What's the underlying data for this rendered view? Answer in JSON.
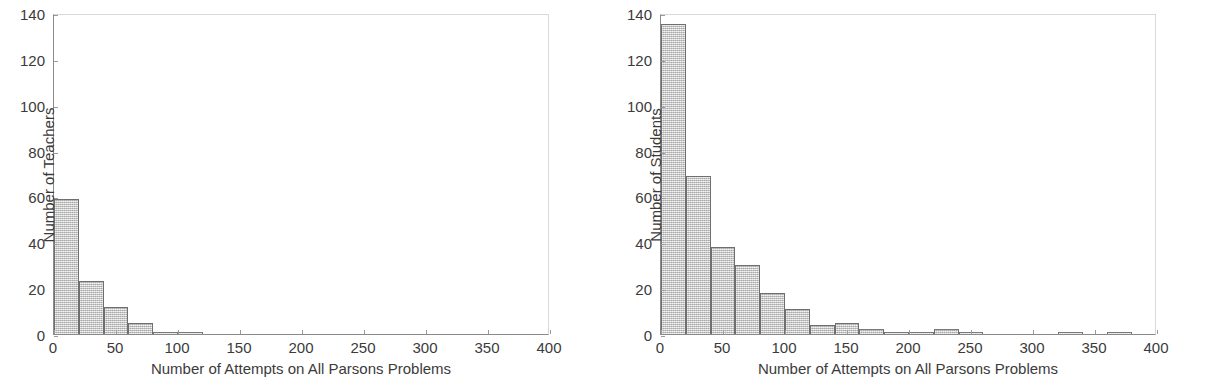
{
  "figure": {
    "background": "#ffffff",
    "bar_fill": "#c9c9c9",
    "bar_edge": "#6f6f6f",
    "axis_color": "#8a8a8a",
    "text_color": "#3b3b3b"
  },
  "panels": [
    {
      "id": "teachers",
      "chart_data": {
        "type": "bar",
        "title": "",
        "subtitle": "",
        "xlabel": "Number of Attempts on All Parsons Problems",
        "ylabel": "Number of Teachers",
        "xlim": [
          0,
          400
        ],
        "ylim": [
          0,
          140
        ],
        "xticks": [
          0,
          50,
          100,
          150,
          200,
          250,
          300,
          350,
          400
        ],
        "yticks": [
          0,
          20,
          40,
          60,
          80,
          100,
          120,
          140
        ],
        "grid": false,
        "legend": null,
        "bin_width": 20,
        "bins": [
          {
            "x0": 0,
            "x1": 20,
            "value": 59
          },
          {
            "x0": 20,
            "x1": 40,
            "value": 23
          },
          {
            "x0": 40,
            "x1": 60,
            "value": 12
          },
          {
            "x0": 60,
            "x1": 80,
            "value": 5
          },
          {
            "x0": 80,
            "x1": 100,
            "value": 1
          },
          {
            "x0": 100,
            "x1": 120,
            "value": 1
          },
          {
            "x0": 120,
            "x1": 140,
            "value": 0
          },
          {
            "x0": 140,
            "x1": 160,
            "value": 0
          },
          {
            "x0": 160,
            "x1": 180,
            "value": 0
          },
          {
            "x0": 180,
            "x1": 200,
            "value": 0
          },
          {
            "x0": 200,
            "x1": 220,
            "value": 0
          },
          {
            "x0": 220,
            "x1": 240,
            "value": 0
          },
          {
            "x0": 240,
            "x1": 260,
            "value": 0
          },
          {
            "x0": 260,
            "x1": 280,
            "value": 0
          },
          {
            "x0": 280,
            "x1": 300,
            "value": 0
          },
          {
            "x0": 300,
            "x1": 320,
            "value": 0
          },
          {
            "x0": 320,
            "x1": 340,
            "value": 0
          },
          {
            "x0": 340,
            "x1": 360,
            "value": 0
          },
          {
            "x0": 360,
            "x1": 380,
            "value": 0
          },
          {
            "x0": 380,
            "x1": 400,
            "value": 0
          }
        ]
      }
    },
    {
      "id": "students",
      "chart_data": {
        "type": "bar",
        "title": "",
        "subtitle": "",
        "xlabel": "Number of Attempts on All Parsons Problems",
        "ylabel": "Number of Students",
        "xlim": [
          0,
          400
        ],
        "ylim": [
          0,
          140
        ],
        "xticks": [
          0,
          50,
          100,
          150,
          200,
          250,
          300,
          350,
          400
        ],
        "yticks": [
          0,
          20,
          40,
          60,
          80,
          100,
          120,
          140
        ],
        "grid": false,
        "legend": null,
        "bin_width": 20,
        "bins": [
          {
            "x0": 0,
            "x1": 20,
            "value": 135
          },
          {
            "x0": 20,
            "x1": 40,
            "value": 69
          },
          {
            "x0": 40,
            "x1": 60,
            "value": 38
          },
          {
            "x0": 60,
            "x1": 80,
            "value": 30
          },
          {
            "x0": 80,
            "x1": 100,
            "value": 18
          },
          {
            "x0": 100,
            "x1": 120,
            "value": 11
          },
          {
            "x0": 120,
            "x1": 140,
            "value": 4
          },
          {
            "x0": 140,
            "x1": 160,
            "value": 5
          },
          {
            "x0": 160,
            "x1": 180,
            "value": 2
          },
          {
            "x0": 180,
            "x1": 200,
            "value": 1
          },
          {
            "x0": 200,
            "x1": 220,
            "value": 1
          },
          {
            "x0": 220,
            "x1": 240,
            "value": 2
          },
          {
            "x0": 240,
            "x1": 260,
            "value": 1
          },
          {
            "x0": 260,
            "x1": 280,
            "value": 0
          },
          {
            "x0": 280,
            "x1": 300,
            "value": 0
          },
          {
            "x0": 300,
            "x1": 320,
            "value": 0
          },
          {
            "x0": 320,
            "x1": 340,
            "value": 1
          },
          {
            "x0": 340,
            "x1": 360,
            "value": 0
          },
          {
            "x0": 360,
            "x1": 380,
            "value": 1
          },
          {
            "x0": 380,
            "x1": 400,
            "value": 0
          }
        ]
      }
    }
  ]
}
